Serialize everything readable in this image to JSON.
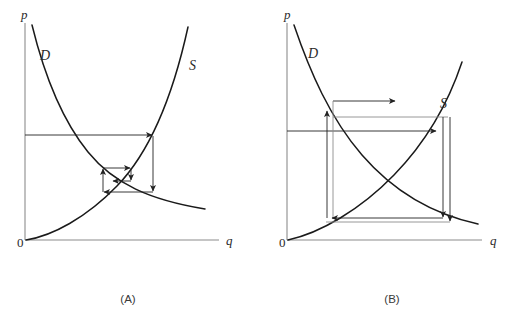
{
  "figure": {
    "background_color": "#ffffff",
    "curve_color": "#1a1a1a",
    "axis_color": "#8c8c8c",
    "cobweb_color": "#8c8c8c",
    "arrow_color": "#222222"
  },
  "panels": [
    {
      "id": "A",
      "caption": "(A)",
      "caption_x": 128,
      "caption_y": 303,
      "axes": {
        "origin_label": "0",
        "origin_label_x": 17,
        "origin_label_y": 247,
        "y_axis_label": "p",
        "y_axis_label_x": 21,
        "y_axis_label_y": 19,
        "x_axis_label": "q",
        "x_axis_label_x": 226,
        "x_axis_label_y": 245,
        "x_axis": {
          "x1": 25,
          "y1": 240,
          "x2": 219,
          "y2": 240
        },
        "y_axis": {
          "x1": 25,
          "y1": 23,
          "x2": 25,
          "y2": 240
        }
      },
      "curves": [
        {
          "name": "demand-curve",
          "label": "D",
          "label_x": 40,
          "label_y": 60,
          "path": "M 32 25 C 45 78, 62 120, 88 152 C 114 184, 150 200, 205 209"
        },
        {
          "name": "supply-curve",
          "label": "S",
          "label_x": 189,
          "label_y": 70,
          "path": "M 26 240 C 52 236, 86 218, 117 186 C 148 154, 172 100, 188 27"
        }
      ],
      "cobweb": {
        "type": "convergent-inward-spiral",
        "description": "Price path spirals inward toward equilibrium",
        "segments": [
          {
            "name": "start-horizontal",
            "x1": 25,
            "y1": 135,
            "x2": 153,
            "y2": 135,
            "arrow": "right"
          },
          {
            "name": "down-to-demand",
            "x1": 153,
            "y1": 135,
            "x2": 153,
            "y2": 192,
            "arrow": "down"
          },
          {
            "name": "left-to-supply",
            "x1": 153,
            "y1": 192,
            "x2": 103,
            "y2": 192,
            "arrow": "left"
          },
          {
            "name": "up-to-supply",
            "x1": 103,
            "y1": 192,
            "x2": 103,
            "y2": 168,
            "arrow": "up"
          },
          {
            "name": "right-inner",
            "x1": 103,
            "y1": 168,
            "x2": 131,
            "y2": 168,
            "arrow": "right"
          },
          {
            "name": "down-inner",
            "x1": 131,
            "y1": 168,
            "x2": 131,
            "y2": 181,
            "arrow": "down"
          },
          {
            "name": "left-inner",
            "x1": 131,
            "y1": 181,
            "x2": 112,
            "y2": 181,
            "arrow": "left"
          }
        ]
      },
      "equilibrium": {
        "x": 120,
        "y": 176
      }
    },
    {
      "id": "B",
      "caption": "(B)",
      "caption_x": 392,
      "caption_y": 303,
      "axes": {
        "origin_label": "0",
        "origin_label_x": 279,
        "origin_label_y": 247,
        "y_axis_label": "p",
        "y_axis_label_x": 284,
        "y_axis_label_y": 19,
        "x_axis_label": "q",
        "x_axis_label_x": 490,
        "x_axis_label_y": 245,
        "x_axis": {
          "x1": 287,
          "y1": 240,
          "x2": 482,
          "y2": 240
        },
        "y_axis": {
          "x1": 287,
          "y1": 23,
          "x2": 287,
          "y2": 240
        }
      },
      "curves": [
        {
          "name": "demand-curve",
          "label": "D",
          "label_x": 308,
          "label_y": 58,
          "path": "M 294 25 C 310 72, 330 118, 362 155 C 394 192, 432 214, 478 224"
        },
        {
          "name": "supply-curve",
          "label": "S",
          "label_x": 440,
          "label_y": 108,
          "path": "M 288 240 C 320 233, 360 210, 394 175 C 428 140, 450 98, 462 62"
        }
      ],
      "cobweb": {
        "type": "divergent-outward-spiral",
        "description": "Price path spirals outward away from equilibrium",
        "segments": [
          {
            "name": "top-outward-right",
            "x1": 333,
            "y1": 101,
            "x2": 396,
            "y2": 101,
            "arrow": "right"
          },
          {
            "name": "upper-horizontal-to-supply",
            "x1": 333,
            "y1": 117,
            "x2": 443,
            "y2": 117,
            "arrow": "right"
          },
          {
            "name": "axis-horizontal-to-supply",
            "x1": 287,
            "y1": 131,
            "x2": 437,
            "y2": 131,
            "arrow": "right"
          },
          {
            "name": "left-vertical-outer",
            "x1": 327,
            "y1": 218,
            "x2": 327,
            "y2": 110,
            "arrow": "up"
          },
          {
            "name": "left-vertical-inner",
            "x1": 333,
            "y1": 218,
            "x2": 333,
            "y2": 101,
            "arrow": "none"
          },
          {
            "name": "right-vertical-outer",
            "x1": 450,
            "y1": 117,
            "x2": 450,
            "y2": 222,
            "arrow": "down"
          },
          {
            "name": "right-vertical-inner",
            "x1": 443,
            "y1": 117,
            "x2": 443,
            "y2": 218,
            "arrow": "down"
          },
          {
            "name": "bottom-horizontal-outer",
            "x1": 450,
            "y1": 222,
            "x2": 325,
            "y2": 222,
            "arrow": "left"
          },
          {
            "name": "bottom-horizontal-inner",
            "x1": 443,
            "y1": 218,
            "x2": 331,
            "y2": 218,
            "arrow": "left"
          }
        ]
      },
      "equilibrium": {
        "x": 379,
        "y": 170
      }
    }
  ]
}
